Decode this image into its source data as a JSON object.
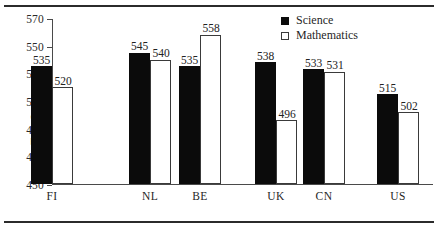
{
  "chart_data": {
    "type": "bar",
    "title": "",
    "xlabel": "",
    "ylabel": "Test Scores",
    "ylim": [
      450,
      570
    ],
    "ytick_step": 20,
    "yticks": [
      570,
      550,
      530,
      510,
      490,
      470,
      450
    ],
    "grid": false,
    "legend_position": "top-right",
    "categories": [
      "FI",
      "NL",
      "BE",
      "UK",
      "CN",
      "US"
    ],
    "series": [
      {
        "name": "Science",
        "color": "#0b0b0b",
        "style": "filled",
        "values": [
          535,
          545,
          535,
          538,
          533,
          515
        ]
      },
      {
        "name": "Mathematics",
        "color": "#ffffff",
        "style": "hollow",
        "values": [
          520,
          540,
          558,
          496,
          531,
          502
        ]
      }
    ],
    "group_layout": [
      {
        "label": "FI",
        "group": 0
      },
      {
        "label": "NL",
        "group": 1
      },
      {
        "label": "BE",
        "group": 1
      },
      {
        "label": "UK",
        "group": 2
      },
      {
        "label": "CN",
        "group": 2
      },
      {
        "label": "US",
        "group": 3
      }
    ]
  },
  "legend": {
    "items": [
      {
        "label": "Science",
        "style": "filled"
      },
      {
        "label": "Mathematics",
        "style": "hollow"
      }
    ]
  },
  "axis": {
    "y_title": "Test Scores",
    "y_tick_labels": [
      "570",
      "550",
      "530",
      "510",
      "490",
      "470",
      "450"
    ],
    "x_tick_labels": [
      "FI",
      "NL",
      "BE",
      "UK",
      "CN",
      "US"
    ]
  },
  "bar_labels": {
    "science": [
      "535",
      "545",
      "535",
      "538",
      "533",
      "515"
    ],
    "mathematics": [
      "520",
      "540",
      "558",
      "496",
      "531",
      "502"
    ]
  }
}
